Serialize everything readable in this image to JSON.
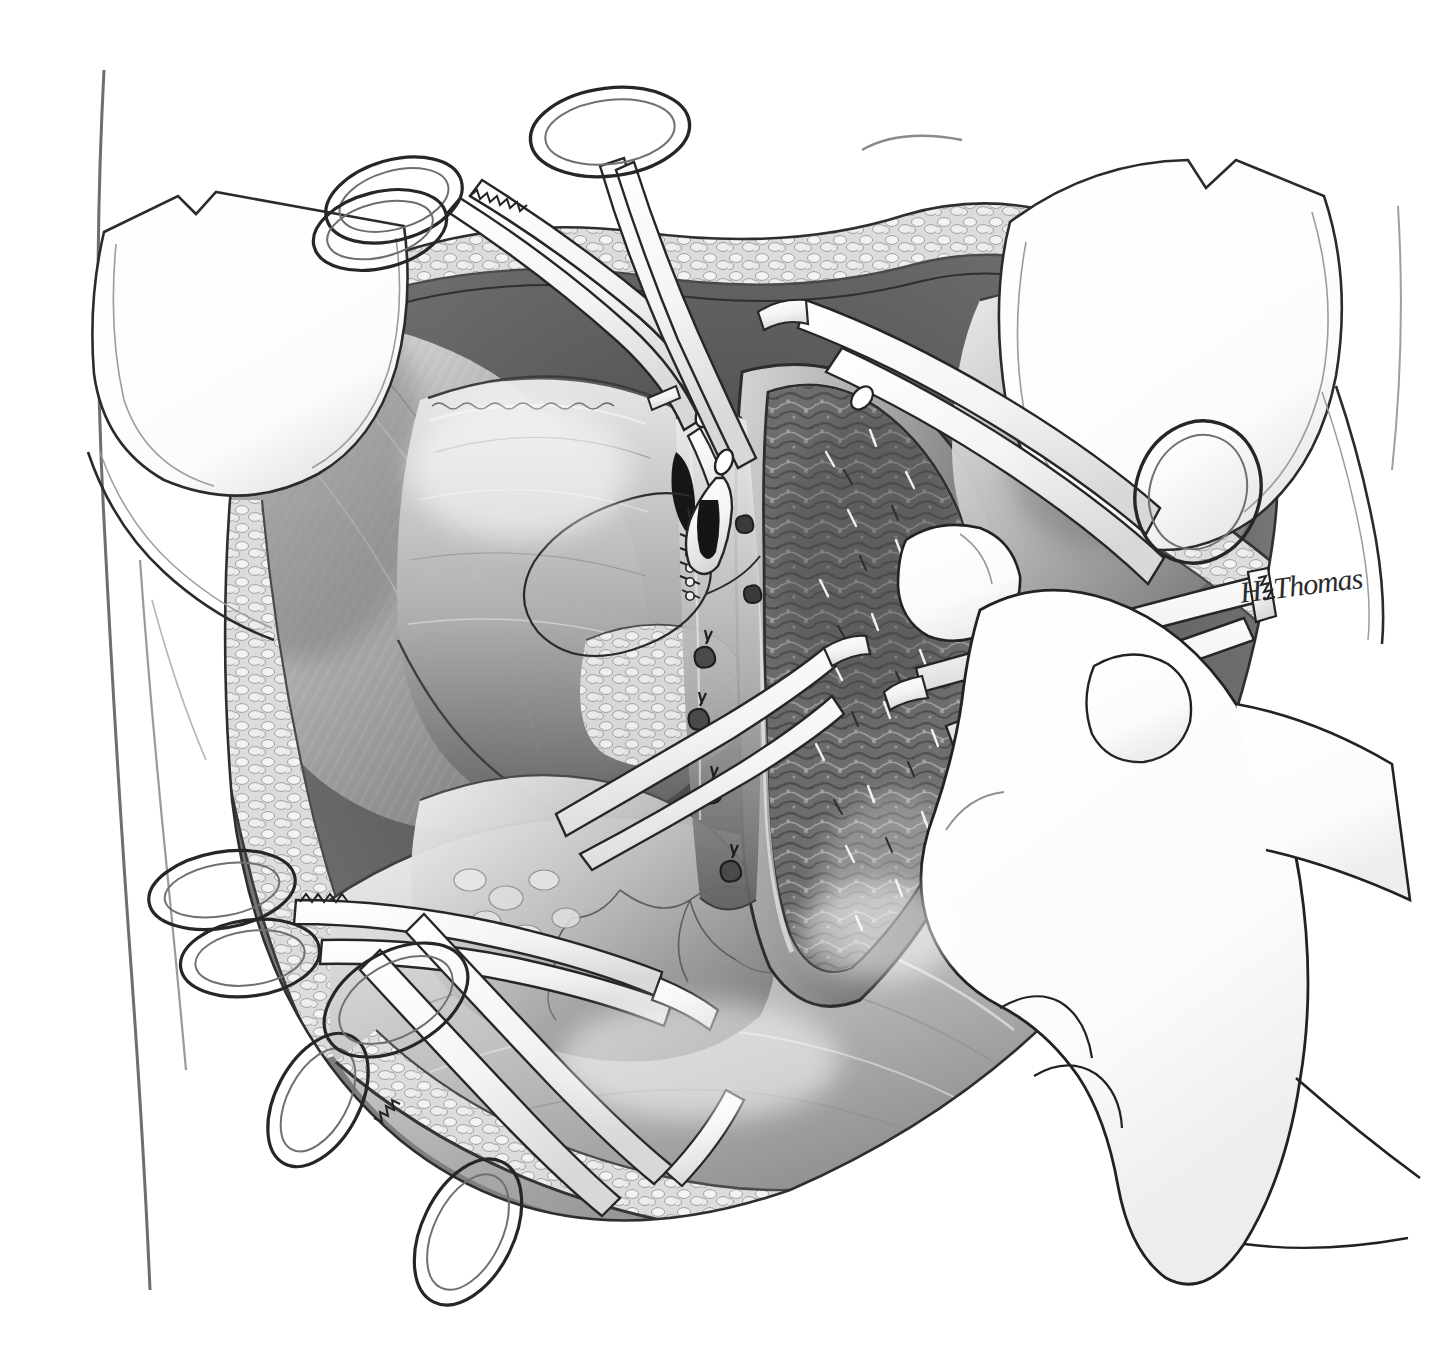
{
  "illustration": {
    "title": "Operative field: lower abdominal laparotomy with hysterotomy",
    "medium": "grayscale pen-and-ink / airbrush medical illustration",
    "background_color": "#ffffff",
    "ink_color": "#1a1a1a",
    "midtone_color": "#8c8c8c",
    "shadow_color": "#3a3a3a",
    "highlight_color": "#f2f2f2",
    "canvas": {
      "width": 1431,
      "height": 1368
    },
    "signature": "H. Thomas",
    "signature_position": {
      "x": 1238,
      "y": 576,
      "rotation_deg": -7
    }
  },
  "scene": {
    "view": "surgeon's view into an open abdominal wound",
    "orientation": "patient supine, head toward top of image",
    "body_outline_label": "patient torso / flank contour at left margin"
  },
  "anatomy": [
    {
      "id": "abdominal-wall-upper",
      "label": "Upper abdominal wall edge",
      "description": "Cut edge of skin, subcutaneous fat and fascia retracted superiorly",
      "tone": "#9a9a9a"
    },
    {
      "id": "abdominal-wall-lower",
      "label": "Lower abdominal wall edge",
      "description": "Cut edge of skin, fat lobules and rectus fascia retracted inferiorly",
      "tone": "#8e8e8e"
    },
    {
      "id": "subcutaneous-fat",
      "label": "Subcutaneous fat",
      "description": "Cobblestone lobules of fat along the entire wound margin",
      "tone": "#d0d0d0"
    },
    {
      "id": "rectus-muscle",
      "label": "Rectus abdominis muscle",
      "description": "Striated muscle belly reflected laterally beneath the retractor",
      "tone": "#a6a6a6"
    },
    {
      "id": "peritoneum-bladder-flap",
      "label": "Vesicouterine peritoneal flap (bladder flap)",
      "description": "Thin translucent serosal sheet dissected down and held to the left",
      "tone": "#bdbdbd"
    },
    {
      "id": "uterus-lower-segment",
      "label": "Lower uterine segment",
      "description": "Smooth myometrial surface with fine serosal vessels",
      "tone": "#a0a0a0"
    },
    {
      "id": "hysterotomy-incision",
      "label": "Hysterotomy incision",
      "description": "Open transverse uterine incision exposing decidua / endometrial cavity",
      "tone": "#6a6a6a"
    },
    {
      "id": "endometrial-surface",
      "label": "Endometrial / decidual surface",
      "description": "Coarse, granular, heavily textured cavity lining seen through the open incision",
      "tone": "#555555"
    },
    {
      "id": "bowel-omentum",
      "label": "Bowel and omentum",
      "description": "Smooth visceral mass filling the lower half of the field",
      "tone": "#b4b4b4"
    },
    {
      "id": "serosal-vessels",
      "label": "Serosal blood vessels",
      "description": "Branching fine vessels traced on the uterine and visceral surfaces",
      "tone": "#7a7a7a"
    }
  ],
  "instruments": [
    {
      "id": "retractor-left",
      "label": "Malleable / Deaver retractor blade (left)",
      "type": "retractor",
      "position": "upper-left of wound",
      "notes": "Broad white blade with notched shoulder, lifting the left abdominal wall"
    },
    {
      "id": "retractor-right",
      "label": "Malleable / Deaver retractor blade (right)",
      "type": "retractor",
      "position": "upper-right of wound",
      "notes": "Mirror-image broad blade lifting the right abdominal wall"
    },
    {
      "id": "hemostat-top-left",
      "label": "Kelly hemostat on fascial edge",
      "type": "ratcheted-clamp",
      "position": "top-left",
      "notes": "Ring handles with ratchet teeth, tips on the cut fascial edge"
    },
    {
      "id": "hemostat-top-center",
      "label": "Allis tissue forceps",
      "type": "ratcheted-clamp",
      "position": "top-center",
      "notes": "Long shank running down into the wound, jaws grasping peritoneum"
    },
    {
      "id": "clamp-upper-right",
      "label": "Curved clamp entering from the right",
      "type": "ratcheted-clamp",
      "position": "upper-right crossing the field",
      "notes": "Shank passes over the uterine incision toward the cavity"
    },
    {
      "id": "clamp-in-hand",
      "label": "Ring-handled clamp held by the surgeon",
      "type": "ratcheted-clamp",
      "position": "right, in gloved hand",
      "notes": "Box-lock and ratchet visible; thumb and ring finger in the rings"
    },
    {
      "id": "hemostat-lower-left",
      "label": "Hemostat on lower-left wound edge",
      "type": "ratcheted-clamp",
      "position": "lower-left",
      "notes": "Ring handles projecting out of the field to the left"
    },
    {
      "id": "hemostat-lower-center",
      "label": "Hemostat on lower wound edge",
      "type": "ratcheted-clamp",
      "position": "bottom-center",
      "notes": "Long ring handle hanging below the incision"
    },
    {
      "id": "forceps-central",
      "label": "Dissecting forceps in the incision",
      "type": "forceps",
      "position": "center of the hysterotomy",
      "notes": "Fine tips separating the incision edges"
    }
  ],
  "surgeon_hand": {
    "label": "Surgeon's gloved right hand",
    "description": "Latex-gloved hand entering from the right margin, index finger steadying the clamp shank, thumb and fingers through the ring handles",
    "glove_tone": "#ffffff",
    "outline_tone": "#2a2a2a"
  },
  "sutures": [
    {
      "id": "suture-loop",
      "label": "Suture loop with swaged needle",
      "description": "Long looping strand of suture lying across the bladder flap at center-left"
    },
    {
      "id": "running-stitch",
      "label": "Running locked stitch",
      "description": "Short row of locked bites closing the superior apex of the uterine incision"
    },
    {
      "id": "figure-eight-ties",
      "label": "Figure-of-eight hemostatic ties",
      "description": "Four small knotted ties placed along the left edge of the hysterotomy"
    },
    {
      "id": "vessel-clips",
      "label": "Small hemostatic clips / bleeders",
      "description": "Scattered short dark marks over the endometrial surface marking bleeding points"
    }
  ],
  "annotations": {
    "caption": "",
    "figure_number": "",
    "legend": []
  }
}
